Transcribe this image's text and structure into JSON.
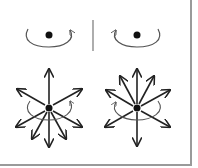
{
  "figure": {
    "colors": {
      "stroke": "#222222",
      "arc": "#555555",
      "border": "#9a9a9a",
      "background": "#ffffff"
    },
    "panels": [
      {
        "id": "top-left",
        "type": "rotation",
        "direction": "counterclockwise-viewed-from-front",
        "arrowhead": "right"
      },
      {
        "id": "top-right",
        "type": "rotation",
        "direction": "clockwise-viewed-from-front",
        "arrowhead": "left"
      },
      {
        "id": "bottom-left",
        "type": "radial-arrows-with-rotation",
        "arrow_count": 8,
        "arrowhead": "right"
      },
      {
        "id": "bottom-right",
        "type": "radial-arrows-with-rotation",
        "arrow_count": 8,
        "arrowhead": "left"
      }
    ]
  }
}
